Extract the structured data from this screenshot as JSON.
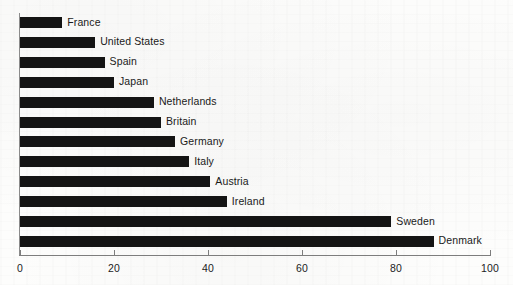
{
  "chart_data": {
    "type": "bar",
    "orientation": "horizontal",
    "title": "",
    "subtitle": "",
    "xlabel": "",
    "ylabel": "",
    "xlim": [
      0,
      100
    ],
    "grid": false,
    "legend": "none",
    "bar_color": "#141414",
    "axis_color": "#7d7d7d",
    "label_color": "#1a1a1a",
    "background_color": "#fdfdfc",
    "x_ticks": [
      0,
      20,
      40,
      60,
      80,
      100
    ],
    "x_tick_labels": [
      "0",
      "20",
      "40",
      "60",
      "80",
      "100"
    ],
    "categories": [
      "France",
      "United States",
      "Spain",
      "Japan",
      "Netherlands",
      "Britain",
      "Germany",
      "Italy",
      "Austria",
      "Ireland",
      "Sweden",
      "Denmark"
    ],
    "values": [
      9,
      16,
      18,
      20,
      28.5,
      30,
      33,
      36,
      40.5,
      44,
      79,
      88
    ]
  }
}
